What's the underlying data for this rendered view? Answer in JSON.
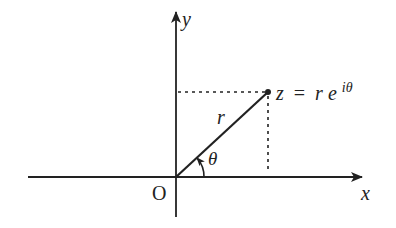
{
  "diagram": {
    "type": "complex-plane-polar-form",
    "colors": {
      "ink": "#222222",
      "background": "#ffffff"
    },
    "axes": {
      "x_label": "x",
      "y_label": "y",
      "origin_label": "O"
    },
    "vector": {
      "length_label": "r",
      "angle_label": "θ"
    },
    "point": {
      "label_lhs": "z",
      "label_eq": "=",
      "label_r": "r",
      "label_e": "e",
      "label_exp": "iθ"
    },
    "projections": {
      "style": "dotted"
    }
  }
}
